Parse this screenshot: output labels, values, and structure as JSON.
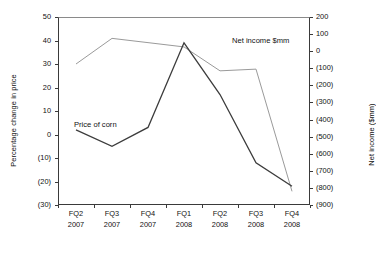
{
  "chart_data": {
    "type": "line",
    "title": "",
    "xlabel": "",
    "categories": [
      "FQ2\n2007",
      "FQ3\n2007",
      "FQ4\n2007",
      "FQ1\n2008",
      "FQ2\n2008",
      "FQ3\n2008",
      "FQ4\n2008"
    ],
    "category_lines": [
      {
        "quarter": "FQ2",
        "year": "2007"
      },
      {
        "quarter": "FQ3",
        "year": "2007"
      },
      {
        "quarter": "FQ4",
        "year": "2007"
      },
      {
        "quarter": "FQ1",
        "year": "2008"
      },
      {
        "quarter": "FQ2",
        "year": "2008"
      },
      {
        "quarter": "FQ3",
        "year": "2008"
      },
      {
        "quarter": "FQ4",
        "year": "2008"
      }
    ],
    "axes": {
      "left": {
        "label": "Percentage change in price",
        "ylim": [
          -30,
          50
        ],
        "ticks": [
          50,
          40,
          30,
          20,
          10,
          0,
          -10,
          -20,
          -30
        ],
        "tick_labels": [
          "50",
          "40",
          "30",
          "20",
          "10",
          "0",
          "(10)",
          "(20)",
          "(30)"
        ]
      },
      "right": {
        "label": "Net income ($mm)",
        "ylim": [
          -900,
          200
        ],
        "ticks": [
          200,
          100,
          0,
          -100,
          -200,
          -300,
          -400,
          -500,
          -600,
          -700,
          -800,
          -900
        ],
        "tick_labels": [
          "200",
          "100",
          "0",
          "(100)",
          "(200)",
          "(300)",
          "(400)",
          "(500)",
          "(600)",
          "(700)",
          "(800)",
          "(900)"
        ]
      }
    },
    "grid": false,
    "legend_position": "inline-annotations",
    "series": [
      {
        "name": "Price of corn",
        "axis": "left",
        "color": "#3c3c3c",
        "values": [
          2,
          -5,
          3,
          39,
          17,
          -12,
          -22
        ],
        "annotation": "Price of corn"
      },
      {
        "name": "Net income $mm",
        "axis": "right",
        "color": "#9a9a9a",
        "values": [
          -75,
          75,
          50,
          25,
          -115,
          -105,
          -820
        ],
        "annotation": "Net income $mm"
      }
    ]
  }
}
